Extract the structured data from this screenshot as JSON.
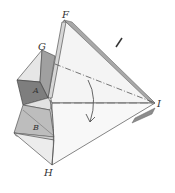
{
  "diagram": {
    "type": "origami-fold-illustration",
    "labels": {
      "F": "F",
      "G": "G",
      "A": "A",
      "B": "B",
      "H": "H",
      "I": "I"
    },
    "colors": {
      "background": "#ffffff",
      "line": "#555555",
      "light_face": "#ececec",
      "mid_face": "#c8c8c8",
      "dark_face": "#8a8a8a",
      "lightest_face": "#f6f6f6"
    },
    "annotations": {
      "fold_arrow": "curved-down-arrow",
      "dash_dot_line": "G to I",
      "dashed_line": "left to I",
      "tick_mark": "mark near F-I edge"
    }
  }
}
